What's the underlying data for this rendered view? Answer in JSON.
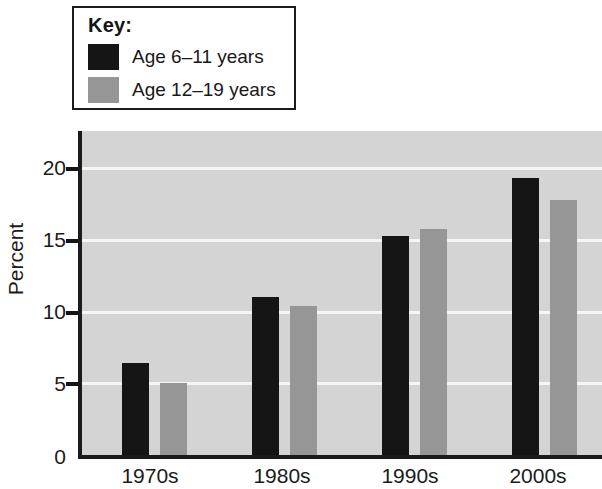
{
  "legend": {
    "title": "Key:",
    "entries": [
      {
        "label": "Age 6–11 years",
        "color": "#151515",
        "swatch_name": "legend-swatch-black"
      },
      {
        "label": "Age 12–19 years",
        "color": "#969696",
        "swatch_name": "legend-swatch-gray"
      }
    ]
  },
  "axis": {
    "y_title": "Percent",
    "y_ticks": [
      "0",
      "5",
      "10",
      "15",
      "20"
    ],
    "x_ticks": [
      "1970s",
      "1980s",
      "1990s",
      "2000s"
    ]
  },
  "chart_data": {
    "type": "bar",
    "title": "",
    "subtitle": "",
    "xlabel": "",
    "ylabel": "Percent",
    "categories": [
      "1970s",
      "1980s",
      "1990s",
      "2000s"
    ],
    "series": [
      {
        "name": "Age 6–11 years",
        "color": "#151515",
        "values": [
          6.4,
          11.0,
          15.3,
          19.3
        ]
      },
      {
        "name": "Age 12–19 years",
        "color": "#969696",
        "values": [
          5.0,
          10.4,
          15.8,
          17.8
        ]
      }
    ],
    "ylim": [
      0,
      22.6
    ],
    "ytick_values": [
      0,
      5,
      10,
      15,
      20
    ],
    "grid": true,
    "gridline_color": "#f5f5f5",
    "plot_background": "#d4d4d4",
    "legend_position": "above-left"
  }
}
